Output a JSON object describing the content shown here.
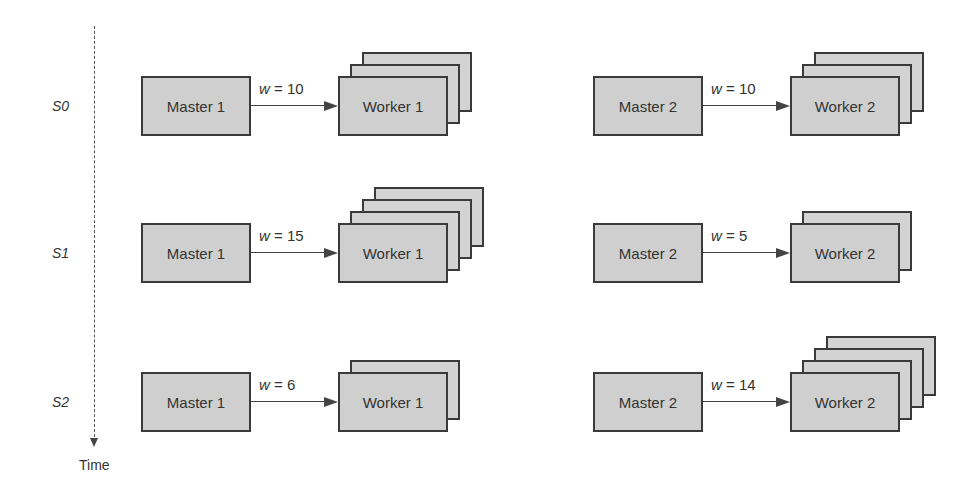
{
  "axis": {
    "label": "Time"
  },
  "stages": [
    {
      "label": "S0",
      "y": 76,
      "groups": [
        {
          "master": "Master 1",
          "worker": "Worker 1",
          "weight_label": "w = 10",
          "w": 10,
          "worker_count": 3,
          "x": 141
        },
        {
          "master": "Master 2",
          "worker": "Worker 2",
          "weight_label": "w = 10",
          "w": 10,
          "worker_count": 3,
          "x": 593
        }
      ]
    },
    {
      "label": "S1",
      "y": 223,
      "groups": [
        {
          "master": "Master 1",
          "worker": "Worker 1",
          "weight_label": "w = 15",
          "w": 15,
          "worker_count": 4,
          "x": 141
        },
        {
          "master": "Master 2",
          "worker": "Worker 2",
          "weight_label": "w = 5",
          "w": 5,
          "worker_count": 2,
          "x": 593
        }
      ]
    },
    {
      "label": "S2",
      "y": 372,
      "groups": [
        {
          "master": "Master 1",
          "worker": "Worker 1",
          "weight_label": "w = 6",
          "w": 6,
          "worker_count": 2,
          "x": 141
        },
        {
          "master": "Master 2",
          "worker": "Worker 2",
          "weight_label": "w = 14",
          "w": 14,
          "worker_count": 4,
          "x": 593
        }
      ]
    }
  ]
}
